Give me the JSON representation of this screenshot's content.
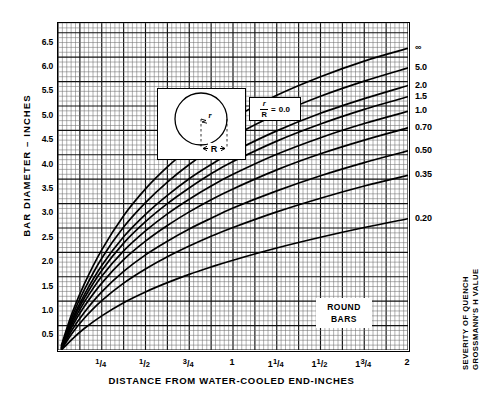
{
  "chart_data": {
    "type": "line",
    "title": "",
    "xlabel": "DISTANCE FROM WATER-COOLED END-INCHES",
    "ylabel": "BAR DIAMETER – INCHES",
    "ylabel_right_line1": "SEVERITY OF QUENCH",
    "ylabel_right_line2": "GROSSMANN'S H VALUE",
    "xlim": [
      0,
      2
    ],
    "ylim": [
      0.2,
      6.9
    ],
    "grid": true,
    "legend_position": "right-of-curve-ends",
    "xticks": [
      0.25,
      0.5,
      0.75,
      1.0,
      1.25,
      1.5,
      1.75,
      2.0
    ],
    "xtick_labels": [
      "1/4",
      "1/2",
      "3/4",
      "1",
      "1 1/4",
      "1 1/2",
      "1 3/4",
      "2"
    ],
    "yticks": [
      0.5,
      1.0,
      1.5,
      2.0,
      2.5,
      3.0,
      3.5,
      4.0,
      4.5,
      5.0,
      5.5,
      6.0,
      6.5
    ],
    "ytick_labels": [
      "0.5",
      "1.0",
      "1.5",
      "2.0",
      "2.5",
      "3.0",
      "3.5",
      "4.0",
      "4.5",
      "5.0",
      "5.5",
      "6.0",
      "6.5"
    ],
    "annotations": [
      {
        "name": "round-bars",
        "text_line1": "ROUND",
        "text_line2": "BARS"
      },
      {
        "name": "ratio-box",
        "numerator": "r",
        "denominator": "R",
        "operator": "=",
        "value": "0.0"
      },
      {
        "name": "inset-radius-label",
        "text": "R"
      },
      {
        "name": "inset-small-r-label",
        "text": "r"
      }
    ],
    "series": [
      {
        "name": "∞",
        "label": "∞",
        "x": [
          0.02,
          0.08,
          0.15,
          0.25,
          0.375,
          0.5,
          0.625,
          0.75,
          0.875,
          1.0,
          1.25,
          1.5,
          1.75,
          2.0
        ],
        "y": [
          0.3,
          0.95,
          1.55,
          2.25,
          2.95,
          3.5,
          3.95,
          4.33,
          4.66,
          4.95,
          5.42,
          5.8,
          6.12,
          6.38
        ]
      },
      {
        "name": "5.0",
        "label": "5.0",
        "x": [
          0.02,
          0.08,
          0.15,
          0.25,
          0.375,
          0.5,
          0.625,
          0.75,
          0.875,
          1.0,
          1.25,
          1.5,
          1.75,
          2.0
        ],
        "y": [
          0.28,
          0.88,
          1.43,
          2.08,
          2.72,
          3.22,
          3.64,
          4.0,
          4.31,
          4.58,
          5.03,
          5.4,
          5.71,
          5.98
        ]
      },
      {
        "name": "2.0",
        "label": "2.0",
        "x": [
          0.02,
          0.08,
          0.15,
          0.25,
          0.375,
          0.5,
          0.625,
          0.75,
          0.875,
          1.0,
          1.25,
          1.5,
          1.75,
          2.0
        ],
        "y": [
          0.26,
          0.82,
          1.33,
          1.93,
          2.52,
          2.98,
          3.37,
          3.71,
          4.0,
          4.26,
          4.69,
          5.05,
          5.35,
          5.62
        ]
      },
      {
        "name": "1.5",
        "label": "1.5",
        "x": [
          0.02,
          0.08,
          0.15,
          0.25,
          0.375,
          0.5,
          0.625,
          0.75,
          0.875,
          1.0,
          1.25,
          1.5,
          1.75,
          2.0
        ],
        "y": [
          0.25,
          0.78,
          1.26,
          1.83,
          2.39,
          2.83,
          3.2,
          3.52,
          3.81,
          4.06,
          4.48,
          4.83,
          5.13,
          5.39
        ]
      },
      {
        "name": "1.0",
        "label": "1.0",
        "x": [
          0.02,
          0.08,
          0.15,
          0.25,
          0.375,
          0.5,
          0.625,
          0.75,
          0.875,
          1.0,
          1.25,
          1.5,
          1.75,
          2.0
        ],
        "y": [
          0.24,
          0.73,
          1.18,
          1.71,
          2.23,
          2.64,
          2.99,
          3.29,
          3.56,
          3.8,
          4.21,
          4.55,
          4.84,
          5.09
        ]
      },
      {
        "name": "0.70",
        "label": "0.70",
        "x": [
          0.02,
          0.08,
          0.15,
          0.25,
          0.375,
          0.5,
          0.625,
          0.75,
          0.875,
          1.0,
          1.25,
          1.5,
          1.75,
          2.0
        ],
        "y": [
          0.23,
          0.68,
          1.09,
          1.57,
          2.05,
          2.43,
          2.75,
          3.03,
          3.28,
          3.5,
          3.89,
          4.22,
          4.5,
          4.75
        ]
      },
      {
        "name": "0.50",
        "label": "0.50",
        "x": [
          0.02,
          0.08,
          0.15,
          0.25,
          0.375,
          0.5,
          0.625,
          0.75,
          0.875,
          1.0,
          1.25,
          1.5,
          1.75,
          2.0
        ],
        "y": [
          0.22,
          0.61,
          0.97,
          1.39,
          1.81,
          2.15,
          2.43,
          2.68,
          2.9,
          3.11,
          3.46,
          3.77,
          4.04,
          4.28
        ]
      },
      {
        "name": "0.35",
        "label": "0.35",
        "x": [
          0.02,
          0.08,
          0.15,
          0.25,
          0.375,
          0.5,
          0.625,
          0.75,
          0.875,
          1.0,
          1.25,
          1.5,
          1.75,
          2.0
        ],
        "y": [
          0.21,
          0.54,
          0.85,
          1.21,
          1.57,
          1.86,
          2.11,
          2.33,
          2.53,
          2.71,
          3.03,
          3.31,
          3.56,
          3.78
        ]
      },
      {
        "name": "0.20",
        "label": "0.20",
        "x": [
          0.02,
          0.08,
          0.15,
          0.25,
          0.375,
          0.5,
          0.625,
          0.75,
          0.875,
          1.0,
          1.25,
          1.5,
          1.75,
          2.0
        ],
        "y": [
          0.2,
          0.42,
          0.64,
          0.9,
          1.17,
          1.39,
          1.58,
          1.75,
          1.9,
          2.04,
          2.29,
          2.51,
          2.71,
          2.89
        ]
      }
    ]
  },
  "colors": {
    "ink": "#000000",
    "grid_minor": "#6b6b6b",
    "grid_major": "#1a1a1a",
    "background": "#ffffff"
  }
}
